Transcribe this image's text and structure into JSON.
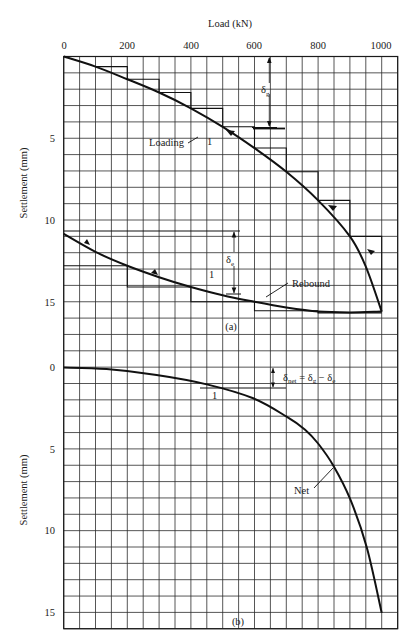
{
  "chart_data": [
    {
      "id": "a",
      "type": "line",
      "panel_label": "(a)",
      "title": "",
      "xlabel": "Load (kN)",
      "ylabel": "Settlement (mm)",
      "x_ticks": [
        0,
        200,
        400,
        600,
        800,
        1000
      ],
      "y_ticks": [
        5,
        10,
        15
      ],
      "xlim": [
        0,
        1050
      ],
      "ylim": [
        0,
        17
      ],
      "y_inverted": true,
      "grid": true,
      "series": [
        {
          "name": "Loading",
          "x": [
            0,
            100,
            200,
            300,
            400,
            500,
            600,
            700,
            800,
            900,
            950,
            1000
          ],
          "y": [
            0,
            0.62,
            1.39,
            2.2,
            3.17,
            4.3,
            5.6,
            7.05,
            8.8,
            11.0,
            12.85,
            15.6
          ]
        },
        {
          "name": "Rebound",
          "x": [
            1000,
            900,
            800,
            700,
            600,
            500,
            400,
            300,
            200,
            100,
            0
          ],
          "y": [
            15.6,
            15.65,
            15.6,
            15.35,
            15.0,
            14.6,
            14.1,
            13.5,
            12.8,
            11.95,
            10.85
          ]
        }
      ],
      "loading_steps": [
        {
          "x0": 100,
          "x1": 200,
          "y": 0.62
        },
        {
          "x0": 200,
          "x1": 300,
          "y": 1.39
        },
        {
          "x0": 300,
          "x1": 400,
          "y": 2.2
        },
        {
          "x0": 400,
          "x1": 500,
          "y": 3.17
        },
        {
          "x0": 500,
          "x1": 600,
          "y": 4.3
        },
        {
          "x0": 600,
          "x1": 700,
          "y": 5.6
        },
        {
          "x0": 700,
          "x1": 800,
          "y": 7.05
        },
        {
          "x0": 800,
          "x1": 900,
          "y": 8.8
        },
        {
          "x0": 900,
          "x1": 1000,
          "y": 11.0
        }
      ],
      "rebound_steps": [
        {
          "x0": 0,
          "x1": 200,
          "y": 12.8
        },
        {
          "x0": 200,
          "x1": 400,
          "y": 14.1
        },
        {
          "x0": 400,
          "x1": 600,
          "y": 15.0
        },
        {
          "x0": 600,
          "x1": 800,
          "y": 15.55
        },
        {
          "x0": 800,
          "x1": 1000,
          "y": 15.68
        }
      ],
      "annotations": [
        {
          "text": "Loading",
          "x": 320,
          "y": 4.6,
          "arrow_to": [
            455,
            4.15
          ]
        },
        {
          "text": "Rebound",
          "x": 760,
          "y": 13.9,
          "arrow_to": [
            620,
            15.05
          ]
        },
        {
          "text": "1",
          "x": 440,
          "y": 4.6
        },
        {
          "text": "1",
          "x": 455,
          "y": 13.7
        },
        {
          "text": "δg",
          "x": 645,
          "y": 1.9
        },
        {
          "text": "δe",
          "x": 525,
          "y": 12.5
        }
      ]
    },
    {
      "id": "b",
      "type": "line",
      "panel_label": "(b)",
      "title": "",
      "xlabel": "Load (kN)",
      "ylabel": "Settlement (mm)",
      "y_ticks": [
        0,
        5,
        10,
        15
      ],
      "xlim": [
        0,
        1050
      ],
      "ylim": [
        0,
        16
      ],
      "y_inverted": true,
      "grid": true,
      "series": [
        {
          "name": "Net",
          "x": [
            0,
            135,
            292,
            450,
            596,
            701,
            759,
            800,
            848,
            900,
            953,
            1000
          ],
          "y": [
            0,
            0.09,
            0.45,
            1.03,
            1.88,
            3.0,
            3.8,
            4.64,
            6.0,
            8.0,
            11.0,
            15.0
          ]
        }
      ],
      "annotations": [
        {
          "text": "Net",
          "x": 775,
          "y": 7.1,
          "arrow_to": [
            848,
            6.0
          ]
        },
        {
          "text": "1",
          "x": 470,
          "y": 1.8
        },
        {
          "text": "δnet = δg − δe",
          "x": 672,
          "y": 0.55
        }
      ]
    }
  ],
  "labels": {
    "x_axis_title": "Load (kN)",
    "y_axis_title_a": "Settlement (mm)",
    "y_axis_title_b": "Settlement (mm)",
    "panel_a": "(a)",
    "panel_b": "(b)",
    "loading": "Loading",
    "rebound": "Rebound",
    "net": "Net",
    "one_a1": "1",
    "one_a2": "1",
    "one_b": "1",
    "delta_g": "δ",
    "delta_g_sub": "g",
    "delta_e": "δ",
    "delta_e_sub": "e",
    "net_eq_d1": "δ",
    "net_eq_sub1": "net",
    "net_eq_mid": " = δ",
    "net_eq_sub2": "g",
    "net_eq_mid2": " − δ",
    "net_eq_sub3": "e"
  },
  "ticks": {
    "x": [
      "0",
      "200",
      "400",
      "600",
      "800",
      "1000"
    ],
    "y_a": [
      "5",
      "10",
      "15"
    ],
    "y_b": [
      "0",
      "5",
      "10",
      "15"
    ]
  }
}
